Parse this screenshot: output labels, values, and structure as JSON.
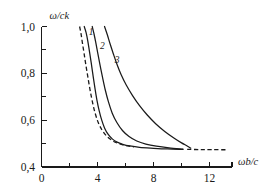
{
  "chart_data": {
    "type": "line",
    "title": "",
    "subtitle": "",
    "xlabel": "ωb/c",
    "ylabel": "ω/ck",
    "xlim": [
      0,
      13.6
    ],
    "ylim": [
      0.4,
      1.0
    ],
    "grid": false,
    "legend_position": "inline-curve-labels",
    "xticks_major": [
      0,
      4,
      8,
      12
    ],
    "xticklabels": [
      "0",
      "4",
      "8",
      "12"
    ],
    "xticks_minor": [
      2,
      6,
      10
    ],
    "yticks_major": [
      0.4,
      0.6,
      0.8,
      1.0
    ],
    "yticklabels": [
      "0,4",
      "0,6",
      "0,8",
      "1,0"
    ],
    "yticks_minor": [
      0.5,
      0.7,
      0.9
    ],
    "asymptote_value": 0.475,
    "annotations": [
      {
        "text": "1",
        "x": 3.55,
        "y": 0.962
      },
      {
        "text": "2",
        "x": 4.35,
        "y": 0.905
      },
      {
        "text": "3",
        "x": 5.4,
        "y": 0.845
      }
    ],
    "series": [
      {
        "name": "1",
        "style": "solid",
        "points": [
          [
            3.05,
            1.0
          ],
          [
            3.18,
            0.975
          ],
          [
            3.3,
            0.94
          ],
          [
            3.42,
            0.895
          ],
          [
            3.55,
            0.845
          ],
          [
            3.68,
            0.79
          ],
          [
            3.82,
            0.735
          ],
          [
            3.96,
            0.685
          ],
          [
            4.12,
            0.64
          ],
          [
            4.3,
            0.6
          ],
          [
            4.5,
            0.567
          ],
          [
            4.75,
            0.54
          ],
          [
            5.05,
            0.52
          ],
          [
            5.4,
            0.506
          ],
          [
            5.8,
            0.497
          ],
          [
            6.3,
            0.49
          ],
          [
            7.0,
            0.484
          ],
          [
            8.0,
            0.48
          ],
          [
            9.0,
            0.477
          ],
          [
            10.1,
            0.4755
          ]
        ]
      },
      {
        "name": "2",
        "style": "solid",
        "points": [
          [
            3.62,
            1.0
          ],
          [
            3.75,
            0.968
          ],
          [
            3.88,
            0.93
          ],
          [
            4.02,
            0.885
          ],
          [
            4.18,
            0.835
          ],
          [
            4.35,
            0.785
          ],
          [
            4.55,
            0.73
          ],
          [
            4.78,
            0.678
          ],
          [
            5.05,
            0.63
          ],
          [
            5.38,
            0.59
          ],
          [
            5.78,
            0.556
          ],
          [
            6.25,
            0.53
          ],
          [
            6.8,
            0.511
          ],
          [
            7.45,
            0.498
          ],
          [
            8.2,
            0.489
          ],
          [
            9.1,
            0.482
          ],
          [
            10.1,
            0.4765
          ]
        ]
      },
      {
        "name": "3",
        "style": "solid",
        "points": [
          [
            4.5,
            1.0
          ],
          [
            4.7,
            0.965
          ],
          [
            4.9,
            0.925
          ],
          [
            5.12,
            0.885
          ],
          [
            5.38,
            0.84
          ],
          [
            5.68,
            0.795
          ],
          [
            6.05,
            0.75
          ],
          [
            6.5,
            0.705
          ],
          [
            7.0,
            0.662
          ],
          [
            7.55,
            0.622
          ],
          [
            8.15,
            0.585
          ],
          [
            8.8,
            0.552
          ],
          [
            9.45,
            0.524
          ],
          [
            10.0,
            0.503
          ],
          [
            10.4,
            0.49
          ],
          [
            10.65,
            0.4805
          ]
        ]
      },
      {
        "name": "light-line-dashed",
        "style": "dashed",
        "points": [
          [
            2.72,
            1.0
          ],
          [
            2.82,
            0.97
          ],
          [
            2.92,
            0.93
          ],
          [
            3.04,
            0.885
          ],
          [
            3.16,
            0.838
          ],
          [
            3.3,
            0.788
          ],
          [
            3.45,
            0.735
          ],
          [
            3.62,
            0.682
          ],
          [
            3.82,
            0.632
          ],
          [
            4.05,
            0.59
          ],
          [
            4.32,
            0.558
          ],
          [
            4.65,
            0.532
          ],
          [
            5.05,
            0.513
          ],
          [
            5.5,
            0.5
          ],
          [
            6.0,
            0.4915
          ],
          [
            6.6,
            0.4855
          ]
        ]
      },
      {
        "name": "asymptote-dashed-tail",
        "style": "dashed",
        "points": [
          [
            10.4,
            0.4752
          ],
          [
            11.3,
            0.4745
          ],
          [
            12.2,
            0.474
          ],
          [
            13.3,
            0.4735
          ]
        ]
      }
    ]
  }
}
